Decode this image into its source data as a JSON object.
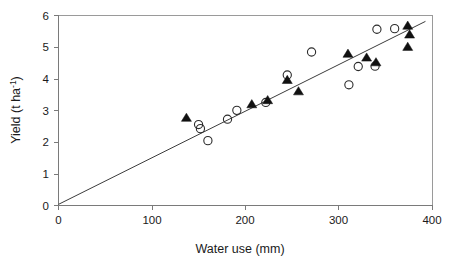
{
  "chart_data": {
    "type": "scatter",
    "title": "",
    "xlabel": "Water use (mm)",
    "ylabel": "Yield (t ha-1)",
    "ylabel_base": "Yield (t ha",
    "ylabel_sup": "-1",
    "ylabel_close": ")",
    "xlim": [
      0,
      400
    ],
    "ylim": [
      0,
      6
    ],
    "xticks": [
      0,
      100,
      200,
      300,
      400
    ],
    "xtick_labels": [
      "0",
      "100",
      "200",
      "300",
      "400"
    ],
    "yticks": [
      0,
      1,
      2,
      3,
      4,
      5,
      6
    ],
    "ytick_labels": [
      "0",
      "1",
      "2",
      "3",
      "4",
      "5",
      "6"
    ],
    "grid": false,
    "legend": "none",
    "series": [
      {
        "name": "open-circles",
        "marker": "open-circle",
        "color": "#2b2b2b",
        "points": [
          [
            150,
            2.55
          ],
          [
            152,
            2.42
          ],
          [
            160,
            2.04
          ],
          [
            181,
            2.72
          ],
          [
            191,
            3.0
          ],
          [
            222,
            3.25
          ],
          [
            245,
            4.12
          ],
          [
            271,
            4.85
          ],
          [
            311,
            3.81
          ],
          [
            321,
            4.39
          ],
          [
            339,
            4.4
          ],
          [
            341,
            5.57
          ],
          [
            360,
            5.59
          ]
        ]
      },
      {
        "name": "filled-triangles",
        "marker": "filled-triangle",
        "color": "#111111",
        "points": [
          [
            137,
            2.76
          ],
          [
            207,
            3.19
          ],
          [
            224,
            3.32
          ],
          [
            245,
            3.96
          ],
          [
            257,
            3.6
          ],
          [
            310,
            4.79
          ],
          [
            330,
            4.67
          ],
          [
            340,
            4.52
          ],
          [
            374,
            5.68
          ],
          [
            376,
            5.4
          ],
          [
            374,
            5.01
          ]
        ]
      }
    ],
    "trendline": {
      "name": "regression-line",
      "from": [
        0,
        0.02
      ],
      "to": [
        393,
        5.82
      ],
      "color": "#3c3c3c"
    }
  }
}
